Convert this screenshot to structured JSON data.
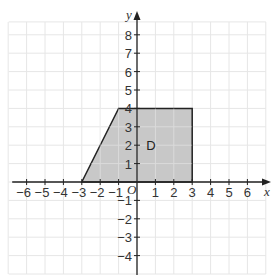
{
  "diagram": {
    "type": "coordinate-grid",
    "x_axis": {
      "label": "x",
      "min": -7,
      "max": 7,
      "ticks": [
        -6,
        -5,
        -4,
        -3,
        -2,
        -1,
        1,
        2,
        3,
        4,
        5,
        6
      ]
    },
    "y_axis": {
      "label": "y",
      "min": -5,
      "max": 8,
      "ticks": [
        8,
        7,
        6,
        5,
        4,
        3,
        2,
        1,
        -1,
        -2,
        -3,
        -4
      ]
    },
    "origin_label": "O",
    "shape": {
      "label": "D",
      "label_position": [
        0.5,
        2
      ],
      "vertices": [
        [
          -3,
          0
        ],
        [
          -1,
          4
        ],
        [
          3,
          4
        ],
        [
          3,
          0
        ]
      ],
      "fill": "#c8c8c8",
      "stroke": "#222222"
    },
    "colors": {
      "grid": "#e6e6e6",
      "axis": "#222222",
      "background": "#ffffff"
    }
  }
}
